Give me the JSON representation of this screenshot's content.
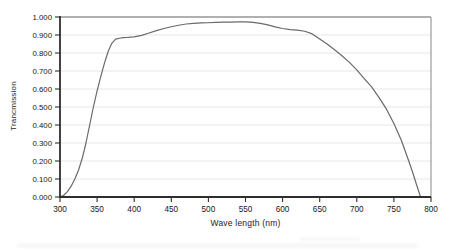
{
  "figure": {
    "background": "#ffffff"
  },
  "chart_data": {
    "type": "line",
    "title": "",
    "xlabel": "Wave length (nm)",
    "ylabel": "Trancmission",
    "xlim": [
      300,
      800
    ],
    "ylim": [
      0,
      1.0
    ],
    "xticks": [
      300,
      350,
      400,
      450,
      500,
      550,
      600,
      650,
      700,
      750,
      800
    ],
    "xtick_labels": [
      "300",
      "350",
      "400",
      "450",
      "500",
      "550",
      "600",
      "650",
      "700",
      "750",
      "800"
    ],
    "yticks": [
      0.0,
      0.1,
      0.2,
      0.3,
      0.4,
      0.5,
      0.6,
      0.7,
      0.8,
      0.9,
      1.0
    ],
    "ytick_labels": [
      "0.000",
      "0.100",
      "0.200",
      "0.300",
      "0.400",
      "0.500",
      "0.600",
      "0.700",
      "0.800",
      "0.900",
      "1.000"
    ],
    "grid": "horizontal",
    "legend": "none",
    "frame": true,
    "series": [
      {
        "x": [
          300,
          305,
          310,
          315,
          320,
          325,
          330,
          335,
          340,
          345,
          350,
          355,
          360,
          365,
          370,
          375,
          380,
          385,
          390,
          395,
          400,
          410,
          420,
          430,
          440,
          450,
          460,
          470,
          480,
          490,
          500,
          510,
          520,
          530,
          540,
          550,
          560,
          570,
          580,
          590,
          600,
          610,
          620,
          630,
          640,
          650,
          660,
          670,
          680,
          690,
          700,
          710,
          720,
          730,
          740,
          750,
          760,
          770,
          775,
          780,
          786
        ],
        "y": [
          0.0,
          0.01,
          0.03,
          0.06,
          0.1,
          0.15,
          0.215,
          0.3,
          0.4,
          0.5,
          0.59,
          0.67,
          0.745,
          0.81,
          0.855,
          0.877,
          0.882,
          0.885,
          0.886,
          0.888,
          0.89,
          0.898,
          0.911,
          0.924,
          0.936,
          0.946,
          0.954,
          0.961,
          0.965,
          0.967,
          0.968,
          0.97,
          0.971,
          0.972,
          0.973,
          0.973,
          0.97,
          0.965,
          0.956,
          0.945,
          0.936,
          0.93,
          0.927,
          0.921,
          0.906,
          0.878,
          0.85,
          0.818,
          0.785,
          0.748,
          0.706,
          0.658,
          0.612,
          0.552,
          0.488,
          0.408,
          0.315,
          0.2,
          0.14,
          0.075,
          0.0
        ]
      }
    ],
    "colors": {
      "line": "#6a6a6a",
      "axis": "#2e2e2e",
      "frame": "#9a9a9a",
      "grid": "#e9e5e5",
      "text": "#161616"
    }
  }
}
